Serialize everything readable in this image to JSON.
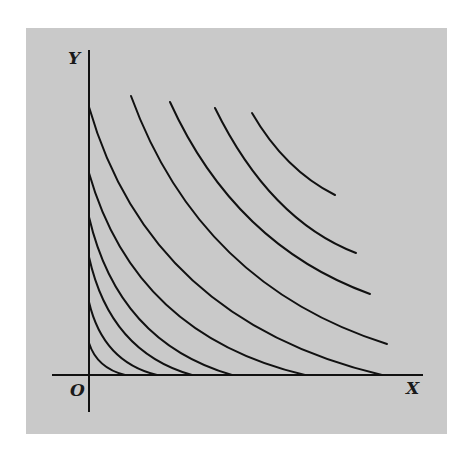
{
  "figure": {
    "background": "#c9c9c9",
    "ink": "#111111",
    "labels": {
      "y_axis": "Y",
      "x_axis": "X",
      "origin": "O"
    }
  },
  "chart_data": {
    "type": "line",
    "title": "",
    "xlabel": "X",
    "ylabel": "Y",
    "origin_label": "O",
    "axes_px": {
      "origin": [
        89,
        375
      ],
      "y_axis_top": 50,
      "y_axis_bottom": 412,
      "x_axis_left": 52,
      "x_axis_right": 423
    },
    "series": [
      {
        "name": "curve-1",
        "start": [
          89,
          343
        ],
        "end": [
          125,
          375
        ],
        "ctrl": [
          97,
          368
        ]
      },
      {
        "name": "curve-2",
        "start": [
          89,
          302
        ],
        "end": [
          157,
          375
        ],
        "ctrl": [
          103,
          362
        ]
      },
      {
        "name": "curve-3",
        "start": [
          89,
          257
        ],
        "end": [
          192,
          375
        ],
        "ctrl": [
          110,
          352
        ]
      },
      {
        "name": "curve-4",
        "start": [
          89,
          217
        ],
        "end": [
          232,
          375
        ],
        "ctrl": [
          118,
          342
        ]
      },
      {
        "name": "curve-5",
        "start": [
          89,
          173
        ],
        "end": [
          305,
          375
        ],
        "ctrl": [
          135,
          335
        ]
      },
      {
        "name": "curve-6",
        "start": [
          89,
          107
        ],
        "end": [
          382,
          375
        ],
        "ctrl": [
          150,
          320
        ]
      },
      {
        "name": "curve-7",
        "start": [
          131,
          96
        ],
        "end": [
          387,
          344
        ],
        "ctrl": [
          200,
          285
        ]
      },
      {
        "name": "curve-8",
        "start": [
          170,
          102
        ],
        "end": [
          370,
          294
        ],
        "ctrl": [
          235,
          245
        ]
      },
      {
        "name": "curve-9",
        "start": [
          215,
          108
        ],
        "end": [
          356,
          253
        ],
        "ctrl": [
          270,
          220
        ]
      },
      {
        "name": "curve-10",
        "start": [
          252,
          113
        ],
        "end": [
          335,
          195
        ],
        "ctrl": [
          285,
          170
        ]
      }
    ]
  }
}
